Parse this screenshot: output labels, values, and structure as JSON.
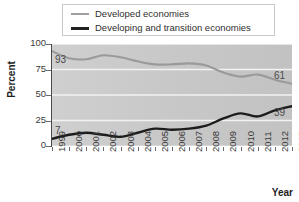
{
  "chart_data": {
    "type": "line",
    "title": "",
    "xlabel": "Year",
    "ylabel": "Percent",
    "ylim": [
      0,
      100
    ],
    "yticks": [
      0,
      25,
      50,
      75,
      100
    ],
    "grid": true,
    "legend_position": "top",
    "categories": [
      "1999",
      "2000",
      "2001",
      "2002",
      "2003",
      "2004",
      "2005",
      "2006",
      "2007",
      "2008",
      "2009",
      "2010",
      "2011",
      "2012",
      "2013"
    ],
    "series": [
      {
        "name": "Developed economies",
        "color": "#9a9a9a",
        "values": [
          93,
          86,
          85,
          89,
          87,
          83,
          80,
          80,
          81,
          79,
          72,
          68,
          70,
          65,
          61
        ],
        "endpoint_labels": {
          "start": "93",
          "end": "61"
        }
      },
      {
        "name": "Developing and transition economies",
        "color": "#1c1c1c",
        "values": [
          7,
          11,
          13,
          11,
          9,
          13,
          17,
          16,
          17,
          20,
          27,
          32,
          29,
          35,
          39
        ],
        "endpoint_labels": {
          "start": "7",
          "end": "39"
        }
      }
    ],
    "annotations": [
      {
        "text": "93",
        "series": "Developed economies",
        "at": "1999"
      },
      {
        "text": "61",
        "series": "Developed economies",
        "at": "2013"
      },
      {
        "text": "7",
        "series": "Developing and transition economies",
        "at": "1999"
      },
      {
        "text": "39",
        "series": "Developing and transition economies",
        "at": "2013"
      }
    ]
  },
  "legend": {
    "items": [
      {
        "label": "Developed economies"
      },
      {
        "label": "Developing and transition economies"
      }
    ]
  },
  "axes": {
    "y_title": "Percent",
    "x_title": "Year"
  }
}
